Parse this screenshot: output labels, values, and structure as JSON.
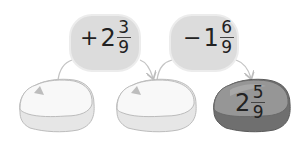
{
  "colors": {
    "bubble_fill": "#dcdcdc",
    "bubble_stroke": "#e8e8e8",
    "stone_light_fill": "#f7f7f7",
    "stone_light_side": "#e4e4e4",
    "stone_dark_fill": "#8f8f8f",
    "stone_dark_side": "#6e6e6e",
    "arrow": "#bdbdbd",
    "text": "#222222"
  },
  "operations": [
    {
      "sign": "+",
      "whole": "2",
      "numerator": "3",
      "denominator": "9"
    },
    {
      "sign": "−",
      "whole": "1",
      "numerator": "6",
      "denominator": "9"
    }
  ],
  "stones": [
    {
      "label": "",
      "style": "light"
    },
    {
      "label": "",
      "style": "light"
    },
    {
      "style": "dark",
      "whole": "2",
      "numerator": "5",
      "denominator": "9"
    }
  ]
}
